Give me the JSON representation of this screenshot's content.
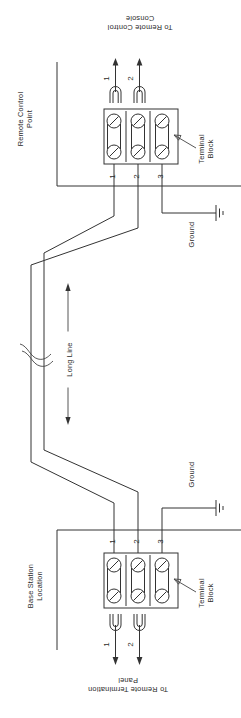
{
  "diagram": {
    "orientation_note": "page rotated 90 degrees",
    "line_color": "#333333",
    "text_color": "#2b2b2b",
    "background": "#ffffff"
  },
  "top_section": {
    "area_label_line1": "Remote Control",
    "area_label_line2": "Point",
    "destination_line1": "To Remote Control",
    "destination_line2": "Console",
    "terminal_block_label_line1": "Terminal",
    "terminal_block_label_line2": "Block",
    "terminal_numbers": [
      "1",
      "2",
      "3"
    ],
    "jumper_numbers": [
      "1",
      "2"
    ],
    "ground_label": "Ground"
  },
  "middle_section": {
    "long_line_label": "Long Line",
    "break_symbol": "line-break-squiggle",
    "arrow_style": "double-headed"
  },
  "bottom_section": {
    "area_label_line1": "Base Station",
    "area_label_line2": "Location",
    "destination_line1": "To Remote Termination",
    "destination_line2": "Panel",
    "terminal_block_label_line1": "Terminal",
    "terminal_block_label_line2": "Block",
    "terminal_numbers": [
      "1",
      "2",
      "3"
    ],
    "jumper_numbers": [
      "1",
      "2"
    ],
    "ground_label": "Ground"
  }
}
